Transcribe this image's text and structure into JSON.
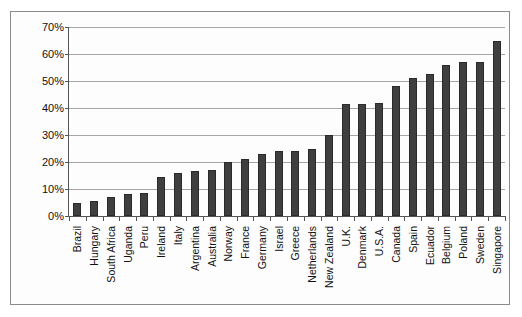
{
  "chart_data": {
    "type": "bar",
    "title": "",
    "xlabel": "",
    "ylabel": "Percent of Nascents",
    "ylim": [
      0,
      70
    ],
    "ytick_labels": [
      "0%",
      "10%",
      "20%",
      "30%",
      "40%",
      "50%",
      "60%",
      "70%"
    ],
    "ytick_values": [
      0,
      10,
      20,
      30,
      40,
      50,
      60,
      70
    ],
    "grid": true,
    "legend": null,
    "categories": [
      "Brazil",
      "Hungary",
      "South Africa",
      "Uganda",
      "Peru",
      "Ireland",
      "Italy",
      "Argentina",
      "Australia",
      "Norway",
      "France",
      "Germany",
      "Israel",
      "Greece",
      "Netherlands",
      "New Zealand",
      "U.K.",
      "Denmark",
      "U.S.A.",
      "Canada",
      "Spain",
      "Ecuador",
      "Belgium",
      "Poland",
      "Sweden",
      "Singapore"
    ],
    "values": [
      5,
      5.5,
      7,
      8,
      8.5,
      14.5,
      16,
      16.5,
      17,
      20,
      21,
      23,
      24,
      24,
      25,
      30,
      41.5,
      41.5,
      42,
      48,
      51,
      52.5,
      56,
      57,
      57,
      65
    ],
    "bar_color": "#3f3f3f",
    "grid_color": "#a6a6a6",
    "axis_color": "#555555",
    "border_color": "#8a8a8a"
  }
}
